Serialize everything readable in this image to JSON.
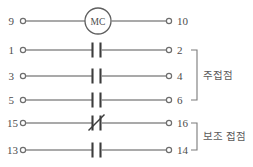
{
  "diagram": {
    "background_color": "#ffffff",
    "wire_color": "#8c8c8c",
    "symbol_color": "#3c3c3c",
    "text_color": "#4d4d4d"
  },
  "coil": {
    "label": "MC",
    "left_terminal": "9",
    "right_terminal": "10"
  },
  "rows": [
    {
      "id": "row-9-10",
      "left_terminal": "9",
      "right_terminal": "10",
      "symbol": "coil-circle",
      "symbol_name": "mc-coil-icon"
    },
    {
      "id": "row-1-2",
      "left_terminal": "1",
      "right_terminal": "2",
      "symbol": "normally-open-contact",
      "symbol_name": "normally-open-contact-icon"
    },
    {
      "id": "row-3-4",
      "left_terminal": "3",
      "right_terminal": "4",
      "symbol": "normally-open-contact",
      "symbol_name": "normally-open-contact-icon"
    },
    {
      "id": "row-5-6",
      "left_terminal": "5",
      "right_terminal": "6",
      "symbol": "normally-open-contact",
      "symbol_name": "normally-open-contact-icon"
    },
    {
      "id": "row-15-16",
      "left_terminal": "15",
      "right_terminal": "16",
      "symbol": "normally-closed-contact",
      "symbol_name": "normally-closed-contact-icon"
    },
    {
      "id": "row-13-14",
      "left_terminal": "13",
      "right_terminal": "14",
      "symbol": "normally-open-contact",
      "symbol_name": "normally-open-contact-icon"
    }
  ],
  "groups": [
    {
      "id": "main-contacts",
      "label": "주접점",
      "covers": [
        "row-1-2",
        "row-3-4",
        "row-5-6"
      ]
    },
    {
      "id": "auxiliary-contacts",
      "label": "보조 접점",
      "covers": [
        "row-15-16",
        "row-13-14"
      ]
    }
  ]
}
